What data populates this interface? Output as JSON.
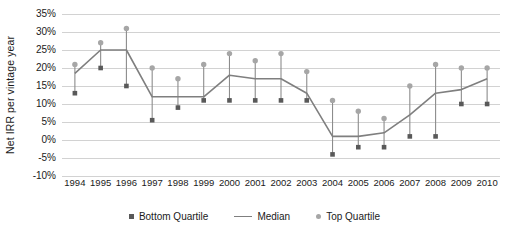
{
  "chart_data": {
    "type": "line",
    "title": "",
    "xlabel": "",
    "ylabel": "Net IRR per vintage year",
    "categories": [
      "1994",
      "1995",
      "1996",
      "1997",
      "1998",
      "1999",
      "2000",
      "2001",
      "2002",
      "2003",
      "2004",
      "2005",
      "2006",
      "2007",
      "2008",
      "2009",
      "2010"
    ],
    "ylim": [
      -10,
      35
    ],
    "ytick_labels": [
      "35%",
      "30%",
      "25%",
      "20%",
      "15%",
      "10%",
      "5%",
      "0%",
      "-5%",
      "-10%"
    ],
    "ytick_values": [
      35,
      30,
      25,
      20,
      15,
      10,
      5,
      0,
      -5,
      -10
    ],
    "grid": true,
    "legend_position": "bottom",
    "series": [
      {
        "name": "Top Quartile",
        "marker": "circle",
        "color": "#a6a6a6",
        "values": [
          21,
          27,
          31,
          20,
          17,
          21,
          24,
          22,
          24,
          19,
          11,
          8,
          6,
          15,
          21,
          20,
          20
        ]
      },
      {
        "name": "Median",
        "marker": "line",
        "color": "#7f7f7f",
        "values": [
          18.5,
          25,
          25,
          12,
          12,
          12,
          18,
          17,
          17,
          13,
          1,
          1,
          2,
          7,
          13,
          14,
          17
        ]
      },
      {
        "name": "Bottom Quartile",
        "marker": "square",
        "color": "#595959",
        "values": [
          13,
          20,
          15,
          5.5,
          9,
          11,
          11,
          11,
          11,
          11,
          -4,
          -2,
          -2,
          1,
          1,
          10,
          10
        ]
      }
    ]
  },
  "legend": {
    "items": [
      {
        "label": "Bottom Quartile",
        "marker": "square"
      },
      {
        "label": "Median",
        "marker": "line"
      },
      {
        "label": "Top Quartile",
        "marker": "circle"
      }
    ]
  }
}
